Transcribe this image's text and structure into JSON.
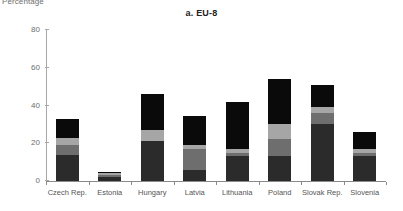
{
  "axis_unit_label": "Percentage",
  "chart_data": {
    "type": "bar",
    "subtype": "stacked-bar",
    "title": "a. EU-8",
    "xlabel": "",
    "ylabel": "Percentage",
    "ylim": [
      0,
      80
    ],
    "yticks": [
      0,
      20,
      40,
      60,
      80
    ],
    "grid": false,
    "legend": "none",
    "categories": [
      "Czech Rep.",
      "Estonia",
      "Hungary",
      "Latvia",
      "Lithuania",
      "Poland",
      "Slovak Rep.",
      "Slovenia"
    ],
    "series": [
      {
        "name": "segment-1",
        "color": "#2b2b2b",
        "values": [
          14,
          2,
          21,
          6,
          13,
          13,
          30,
          13
        ]
      },
      {
        "name": "segment-2",
        "color": "#6e6e6e",
        "values": [
          5,
          1,
          0,
          11,
          2,
          9,
          6,
          2
        ]
      },
      {
        "name": "segment-3",
        "color": "#a6a6a6",
        "values": [
          4,
          1,
          6,
          2,
          2,
          8,
          3,
          2
        ]
      },
      {
        "name": "segment-4",
        "color": "#0a0a0a",
        "values": [
          10,
          1,
          19,
          15.5,
          25,
          24,
          12,
          9
        ]
      }
    ],
    "totals": [
      33,
      5,
      46,
      34.5,
      42,
      54,
      51,
      26
    ]
  }
}
